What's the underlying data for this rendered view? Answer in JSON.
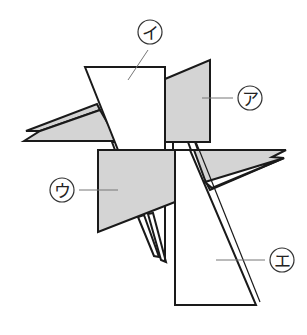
{
  "diagram": {
    "type": "overlapping-shapes-puzzle",
    "colors": {
      "gray_fill": "#d4d4d4",
      "white_fill": "#ffffff",
      "stroke": "#1a1a1a",
      "leader": "#777777"
    },
    "labels": {
      "a": "ア",
      "i": "イ",
      "u": "ウ",
      "e": "エ"
    },
    "shapes": [
      {
        "id": "a",
        "label": "ア",
        "fill": "gray",
        "description": "quadrilateral right of イ"
      },
      {
        "id": "i",
        "label": "イ",
        "fill": "white",
        "description": "trapezoid at top"
      },
      {
        "id": "u",
        "label": "ウ",
        "fill": "gray",
        "description": "quadrilateral lower left"
      },
      {
        "id": "e",
        "label": "エ",
        "fill": "white",
        "description": "tall trapezoid lower right"
      }
    ]
  }
}
